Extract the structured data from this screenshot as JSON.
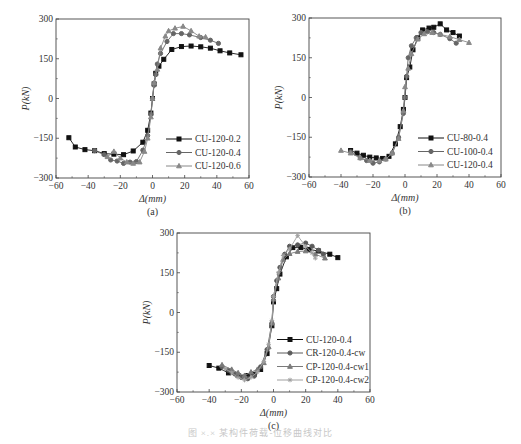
{
  "figure": {
    "caption": "图 ×.×  某构件荷载-位移曲线对比"
  },
  "chart_data": [
    {
      "panel": "(a)",
      "type": "line",
      "xlabel": "Δ(mm)",
      "ylabel": "P(kN)",
      "xlim": [
        -60,
        60
      ],
      "ylim": [
        -300,
        300
      ],
      "xticks": [
        -60,
        -40,
        -20,
        0,
        20,
        40,
        60
      ],
      "yticks": [
        -300,
        -150,
        0,
        150,
        300
      ],
      "grid": false,
      "legend_position": "lower right",
      "frame_px": {
        "x0": 56,
        "x1": 249,
        "y0": 19,
        "y1": 178
      },
      "series": [
        {
          "name": "CU-120-0.2",
          "color": "#111111",
          "marker": "square",
          "points": [
            [
              -52,
              -148
            ],
            [
              -48,
              -183
            ],
            [
              -42,
              -193
            ],
            [
              -36,
              -197
            ],
            [
              -30,
              -208
            ],
            [
              -24,
              -210
            ],
            [
              -18,
              -212
            ],
            [
              -12,
              -198
            ],
            [
              -6,
              -165
            ],
            [
              -3,
              -120
            ],
            [
              -1,
              -55
            ],
            [
              0,
              0
            ],
            [
              1,
              55
            ],
            [
              2,
              95
            ],
            [
              4,
              122
            ],
            [
              7,
              148
            ],
            [
              12,
              185
            ],
            [
              18,
              196
            ],
            [
              24,
              198
            ],
            [
              30,
              195
            ],
            [
              36,
              190
            ],
            [
              42,
              180
            ],
            [
              48,
              172
            ],
            [
              55,
              165
            ]
          ]
        },
        {
          "name": "CU-120-0.4",
          "color": "#666666",
          "marker": "circle",
          "points": [
            [
              -36,
              -197
            ],
            [
              -30,
              -212
            ],
            [
              -26,
              -232
            ],
            [
              -22,
              -236
            ],
            [
              -18,
              -245
            ],
            [
              -14,
              -240
            ],
            [
              -10,
              -238
            ],
            [
              -6,
              -195
            ],
            [
              -3,
              -140
            ],
            [
              -1,
              -60
            ],
            [
              0,
              0
            ],
            [
              1,
              50
            ],
            [
              2,
              90
            ],
            [
              3,
              130
            ],
            [
              5,
              170
            ],
            [
              9,
              215
            ],
            [
              13,
              245
            ],
            [
              18,
              245
            ],
            [
              23,
              240
            ],
            [
              30,
              230
            ],
            [
              36,
              220
            ],
            [
              41,
              208
            ]
          ]
        },
        {
          "name": "CU-120-0.6",
          "color": "#888888",
          "marker": "triangle",
          "points": [
            [
              -28,
              -220
            ],
            [
              -24,
              -200
            ],
            [
              -20,
              -225
            ],
            [
              -16,
              -240
            ],
            [
              -12,
              -245
            ],
            [
              -8,
              -240
            ],
            [
              -5,
              -200
            ],
            [
              -3,
              -150
            ],
            [
              -1,
              -70
            ],
            [
              0,
              0
            ],
            [
              1,
              60
            ],
            [
              3,
              110
            ],
            [
              5,
              190
            ],
            [
              8,
              235
            ],
            [
              10,
              255
            ],
            [
              14,
              265
            ],
            [
              19,
              272
            ],
            [
              24,
              255
            ],
            [
              29,
              235
            ],
            [
              33,
              232
            ]
          ]
        }
      ]
    },
    {
      "panel": "(b)",
      "type": "line",
      "xlabel": "Δ(mm)",
      "ylabel": "P(kN)",
      "xlim": [
        -60,
        60
      ],
      "ylim": [
        -300,
        300
      ],
      "xticks": [
        -60,
        -40,
        -20,
        0,
        20,
        40,
        60
      ],
      "yticks": [
        -300,
        -150,
        0,
        150,
        300
      ],
      "grid": false,
      "legend_position": "lower right",
      "frame_px": {
        "x0": 309,
        "x1": 501,
        "y0": 18,
        "y1": 177
      },
      "series": [
        {
          "name": "CU-80-0.4",
          "color": "#111111",
          "marker": "square",
          "points": [
            [
              -34,
              -200
            ],
            [
              -30,
              -210
            ],
            [
              -26,
              -218
            ],
            [
              -22,
              -225
            ],
            [
              -18,
              -228
            ],
            [
              -14,
              -230
            ],
            [
              -10,
              -222
            ],
            [
              -6,
              -175
            ],
            [
              -3,
              -110
            ],
            [
              -1,
              -45
            ],
            [
              0,
              0
            ],
            [
              1,
              75
            ],
            [
              3,
              115
            ],
            [
              5,
              180
            ],
            [
              8,
              225
            ],
            [
              11,
              255
            ],
            [
              15,
              262
            ],
            [
              18,
              265
            ],
            [
              22,
              278
            ],
            [
              26,
              255
            ],
            [
              30,
              245
            ],
            [
              34,
              232
            ]
          ]
        },
        {
          "name": "CU-100-0.4",
          "color": "#666666",
          "marker": "circle",
          "points": [
            [
              -34,
              -205
            ],
            [
              -28,
              -228
            ],
            [
              -24,
              -238
            ],
            [
              -20,
              -248
            ],
            [
              -16,
              -243
            ],
            [
              -12,
              -232
            ],
            [
              -8,
              -210
            ],
            [
              -4,
              -150
            ],
            [
              -1,
              -60
            ],
            [
              0,
              0
            ],
            [
              1,
              80
            ],
            [
              2,
              150
            ],
            [
              4,
              195
            ],
            [
              7,
              225
            ],
            [
              10,
              245
            ],
            [
              14,
              248
            ],
            [
              18,
              245
            ],
            [
              22,
              238
            ],
            [
              28,
              222
            ],
            [
              32,
              205
            ]
          ]
        },
        {
          "name": "CU-120-0.4",
          "color": "#888888",
          "marker": "triangle",
          "points": [
            [
              -40,
              -200
            ],
            [
              -34,
              -210
            ],
            [
              -28,
              -228
            ],
            [
              -22,
              -238
            ],
            [
              -16,
              -238
            ],
            [
              -12,
              -233
            ],
            [
              -8,
              -210
            ],
            [
              -4,
              -155
            ],
            [
              -1,
              -50
            ],
            [
              0,
              40
            ],
            [
              2,
              110
            ],
            [
              4,
              165
            ],
            [
              8,
              220
            ],
            [
              12,
              240
            ],
            [
              17,
              245
            ],
            [
              22,
              238
            ],
            [
              28,
              230
            ],
            [
              34,
              218
            ],
            [
              40,
              207
            ]
          ]
        }
      ]
    },
    {
      "panel": "(c)",
      "type": "line",
      "xlabel": "Δ(mm)",
      "ylabel": "P(kN)",
      "xlim": [
        -60,
        60
      ],
      "ylim": [
        -300,
        300
      ],
      "xticks": [
        -60,
        -40,
        -20,
        0,
        20,
        40,
        60
      ],
      "yticks": [
        -300,
        -150,
        0,
        150,
        300
      ],
      "grid": false,
      "legend_position": "lower right",
      "frame_px": {
        "x0": 177,
        "x1": 370,
        "y0": 233,
        "y1": 392
      },
      "series": [
        {
          "name": "CU-120-0.4",
          "color": "#111111",
          "marker": "square",
          "points": [
            [
              -40,
              -200
            ],
            [
              -34,
              -210
            ],
            [
              -28,
              -228
            ],
            [
              -22,
              -238
            ],
            [
              -16,
              -238
            ],
            [
              -12,
              -233
            ],
            [
              -8,
              -215
            ],
            [
              -4,
              -155
            ],
            [
              -1,
              -50
            ],
            [
              0,
              40
            ],
            [
              2,
              90
            ],
            [
              4,
              145
            ],
            [
              8,
              210
            ],
            [
              12,
              245
            ],
            [
              17,
              245
            ],
            [
              22,
              238
            ],
            [
              28,
              232
            ],
            [
              35,
              220
            ],
            [
              40,
              207
            ]
          ]
        },
        {
          "name": "CR-120-0.4-cw",
          "color": "#5a5a5a",
          "marker": "circle",
          "points": [
            [
              -32,
              -205
            ],
            [
              -28,
              -218
            ],
            [
              -24,
              -232
            ],
            [
              -20,
              -245
            ],
            [
              -16,
              -250
            ],
            [
              -12,
              -240
            ],
            [
              -8,
              -205
            ],
            [
              -4,
              -140
            ],
            [
              -1,
              -40
            ],
            [
              0,
              60
            ],
            [
              2,
              120
            ],
            [
              4,
              170
            ],
            [
              7,
              220
            ],
            [
              10,
              250
            ],
            [
              15,
              255
            ],
            [
              20,
              262
            ],
            [
              24,
              250
            ],
            [
              28,
              235
            ],
            [
              31,
              220
            ]
          ]
        },
        {
          "name": "CP-120-0.4-cw1",
          "color": "#7a7a7a",
          "marker": "triangle",
          "points": [
            [
              -32,
              -198
            ],
            [
              -26,
              -215
            ],
            [
              -22,
              -228
            ],
            [
              -18,
              -238
            ],
            [
              -14,
              -225
            ],
            [
              -10,
              -215
            ],
            [
              -6,
              -190
            ],
            [
              -3,
              -130
            ],
            [
              -1,
              -40
            ],
            [
              0,
              50
            ],
            [
              3,
              130
            ],
            [
              6,
              200
            ],
            [
              10,
              222
            ],
            [
              15,
              230
            ],
            [
              20,
              232
            ],
            [
              26,
              220
            ],
            [
              32,
              205
            ]
          ]
        },
        {
          "name": "CP-120-0.4-cw2",
          "color": "#a0a0a0",
          "marker": "star",
          "points": [
            [
              -30,
              -212
            ],
            [
              -26,
              -228
            ],
            [
              -22,
              -245
            ],
            [
              -18,
              -255
            ],
            [
              -14,
              -245
            ],
            [
              -10,
              -225
            ],
            [
              -6,
              -185
            ],
            [
              -3,
              -120
            ],
            [
              -1,
              -30
            ],
            [
              0,
              60
            ],
            [
              3,
              150
            ],
            [
              6,
              215
            ],
            [
              10,
              240
            ],
            [
              15,
              290
            ],
            [
              20,
              250
            ],
            [
              24,
              225
            ],
            [
              26,
              205
            ]
          ]
        }
      ]
    }
  ]
}
